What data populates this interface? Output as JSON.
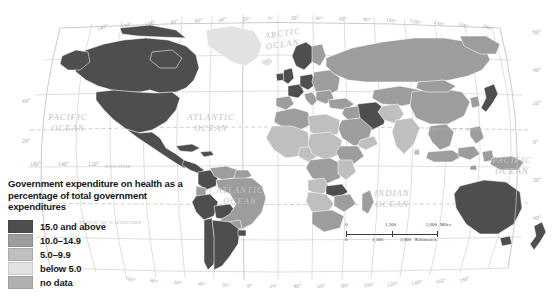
{
  "legend": {
    "title": "Government expenditure on health as a percentage of total government expenditures",
    "items": [
      {
        "label": "15.0 and above",
        "color": "#4e4e4e",
        "swatch_name": "legend-swatch-15-and-above"
      },
      {
        "label": "10.0–14.9",
        "color": "#9d9d9d",
        "swatch_name": "legend-swatch-10-to-14"
      },
      {
        "label": "5.0–9.9",
        "color": "#bfbfbf",
        "swatch_name": "legend-swatch-5-to-9"
      },
      {
        "label": "below 5.0",
        "color": "#e2e2e2",
        "swatch_name": "legend-swatch-below-5"
      },
      {
        "label": "no data",
        "color": "#b0b0b0",
        "swatch_name": "legend-swatch-no-data"
      }
    ]
  },
  "scalebar": {
    "miles": {
      "start": "0",
      "mid": "1,500",
      "end": "3,000",
      "unit": "Miles"
    },
    "kilometers": {
      "start": "0",
      "mid": "1,500",
      "end": "3,000",
      "unit": "Kilometers"
    }
  },
  "map": {
    "ocean_labels": [
      {
        "name": "arctic-ocean",
        "line1": "ARCTIC",
        "line2": "OCEAN",
        "x": 283,
        "y": 36,
        "rotate": -8
      },
      {
        "name": "pacific-ocean-west",
        "line1": "PACIFIC",
        "line2": "OCEAN",
        "x": 68,
        "y": 120,
        "rotate": 0
      },
      {
        "name": "atlantic-ocean-north",
        "line1": "ATLANTIC",
        "line2": "OCEAN",
        "x": 211,
        "y": 120,
        "rotate": 0
      },
      {
        "name": "atlantic-ocean-south",
        "line1": "ATLANTIC",
        "line2": "OCEAN",
        "x": 240,
        "y": 193,
        "rotate": 0
      },
      {
        "name": "indian-ocean",
        "line1": "INDIAN",
        "line2": "OCEAN",
        "x": 392,
        "y": 196,
        "rotate": 0
      },
      {
        "name": "pacific-ocean-east",
        "line1": "PACIFIC",
        "line2": "OCEAN",
        "x": 512,
        "y": 163,
        "rotate": 0
      }
    ],
    "reference_lines": [
      {
        "name": "tropic-of-cancer-east",
        "text": "TROPIC OF CANCER",
        "x": 455,
        "y": 131,
        "rotate": 0
      },
      {
        "name": "equator",
        "text": "EQUATOR",
        "x": 118,
        "y": 168,
        "rotate": 0
      },
      {
        "name": "tropic-of-capricorn-west",
        "text": "TROPIC OF CAPRICORN",
        "x": 110,
        "y": 224,
        "rotate": 0
      }
    ],
    "longitude_labels_top": [
      "140°",
      "120°",
      "100°",
      "80°",
      "60°",
      "40°",
      "20°",
      "0°",
      "20°",
      "40°",
      "60°",
      "80°",
      "100°",
      "120°",
      "140°",
      "160°",
      "180°"
    ],
    "longitude_labels_bottom": [
      "100°",
      "80°",
      "60°",
      "40°",
      "20°",
      "0°",
      "20°",
      "40°",
      "60°",
      "80°",
      "100°",
      "120°",
      "140°",
      "160°",
      "180°"
    ],
    "latitude_labels_left": [
      "40°",
      "20°"
    ],
    "latitude_labels_left_lower": [
      "160°",
      "140°",
      "120°"
    ],
    "latitude_labels_right": [
      "60°",
      "40°",
      "20°",
      "0°",
      "20°",
      "40°"
    ]
  },
  "chart_data": {
    "type": "map",
    "title": "Government expenditure on health as a percentage of total government expenditures",
    "projection": "robinson",
    "classes": [
      {
        "label": "15.0 and above",
        "color": "#4e4e4e"
      },
      {
        "label": "10.0–14.9",
        "color": "#9d9d9d"
      },
      {
        "label": "5.0–9.9",
        "color": "#bfbfbf"
      },
      {
        "label": "below 5.0",
        "color": "#e2e2e2"
      },
      {
        "label": "no data",
        "color": "#b0b0b0"
      }
    ],
    "regions": [
      {
        "name": "Canada",
        "class": "15.0 and above"
      },
      {
        "name": "United States",
        "class": "15.0 and above"
      },
      {
        "name": "Greenland",
        "class": "below 5.0"
      },
      {
        "name": "Mexico",
        "class": "15.0 and above"
      },
      {
        "name": "Cuba",
        "class": "15.0 and above"
      },
      {
        "name": "Central America",
        "class": "15.0 and above"
      },
      {
        "name": "Colombia",
        "class": "15.0 and above"
      },
      {
        "name": "Venezuela",
        "class": "10.0–14.9"
      },
      {
        "name": "Ecuador",
        "class": "10.0–14.9"
      },
      {
        "name": "Peru",
        "class": "15.0 and above"
      },
      {
        "name": "Bolivia",
        "class": "15.0 and above"
      },
      {
        "name": "Brazil",
        "class": "10.0–14.9"
      },
      {
        "name": "Chile",
        "class": "15.0 and above"
      },
      {
        "name": "Argentina",
        "class": "15.0 and above"
      },
      {
        "name": "United Kingdom",
        "class": "15.0 and above"
      },
      {
        "name": "Ireland",
        "class": "15.0 and above"
      },
      {
        "name": "France",
        "class": "15.0 and above"
      },
      {
        "name": "Spain",
        "class": "10.0–14.9"
      },
      {
        "name": "Germany",
        "class": "15.0 and above"
      },
      {
        "name": "Norway",
        "class": "15.0 and above"
      },
      {
        "name": "Sweden",
        "class": "15.0 and above"
      },
      {
        "name": "Finland",
        "class": "10.0–14.9"
      },
      {
        "name": "Italy",
        "class": "10.0–14.9"
      },
      {
        "name": "Eastern Europe",
        "class": "10.0–14.9"
      },
      {
        "name": "Russia",
        "class": "10.0–14.9"
      },
      {
        "name": "Iran",
        "class": "15.0 and above"
      },
      {
        "name": "Saudi Arabia",
        "class": "10.0–14.9"
      },
      {
        "name": "Turkey",
        "class": "10.0–14.9"
      },
      {
        "name": "Egypt",
        "class": "5.0–9.9"
      },
      {
        "name": "Algeria",
        "class": "10.0–14.9"
      },
      {
        "name": "Libya",
        "class": "5.0–9.9"
      },
      {
        "name": "Sudan",
        "class": "5.0–9.9"
      },
      {
        "name": "Nigeria",
        "class": "5.0–9.9"
      },
      {
        "name": "Ethiopia",
        "class": "10.0–14.9"
      },
      {
        "name": "Dem. Rep. Congo",
        "class": "10.0–14.9"
      },
      {
        "name": "Zambia",
        "class": "15.0 and above"
      },
      {
        "name": "Zimbabwe",
        "class": "10.0–14.9"
      },
      {
        "name": "South Africa",
        "class": "10.0–14.9"
      },
      {
        "name": "Madagascar",
        "class": "10.0–14.9"
      },
      {
        "name": "India",
        "class": "5.0–9.9"
      },
      {
        "name": "China",
        "class": "10.0–14.9"
      },
      {
        "name": "Mongolia",
        "class": "10.0–14.9"
      },
      {
        "name": "Japan",
        "class": "15.0 and above"
      },
      {
        "name": "Southeast Asia",
        "class": "10.0–14.9"
      },
      {
        "name": "Indonesia",
        "class": "10.0–14.9"
      },
      {
        "name": "Australia",
        "class": "15.0 and above"
      },
      {
        "name": "New Zealand",
        "class": "15.0 and above"
      }
    ]
  }
}
